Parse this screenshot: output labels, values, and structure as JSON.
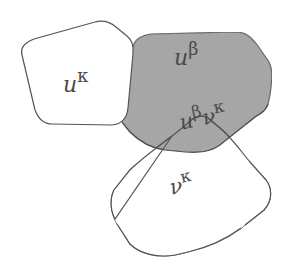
{
  "diagram": {
    "regions": [
      {
        "id": "u-kappa",
        "base": "u",
        "sup": "κ",
        "fill": "#ffffff",
        "shaded": false
      },
      {
        "id": "u-beta",
        "base": "u",
        "sup": "β",
        "fill": "#a9a9a9",
        "shaded": true
      },
      {
        "id": "u-beta-v-kappa",
        "base": "u",
        "sup": "β",
        "base2": "ν",
        "sup2": "κ",
        "fill": "#a9a9a9",
        "shaded": true
      },
      {
        "id": "v-kappa",
        "base": "ν",
        "sup": "κ",
        "fill": "#ffffff",
        "shaded": false
      }
    ],
    "colors": {
      "outline": "#555555",
      "shade": "#a9a9a9",
      "background": "#ffffff",
      "text": "#4a4a4a"
    }
  }
}
